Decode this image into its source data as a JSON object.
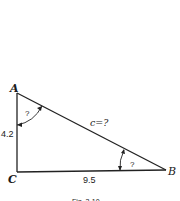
{
  "figure": {
    "vertices": {
      "A": {
        "label": "A"
      },
      "B": {
        "label": "B"
      },
      "C": {
        "label": "C"
      }
    },
    "sides": {
      "AC": {
        "label": "4.2"
      },
      "CB": {
        "label": "9.5"
      },
      "AB": {
        "label": "c=?"
      }
    },
    "angles": {
      "A": {
        "label": "?"
      },
      "B": {
        "label": "?"
      }
    },
    "caption": "Fig. 3-10"
  }
}
